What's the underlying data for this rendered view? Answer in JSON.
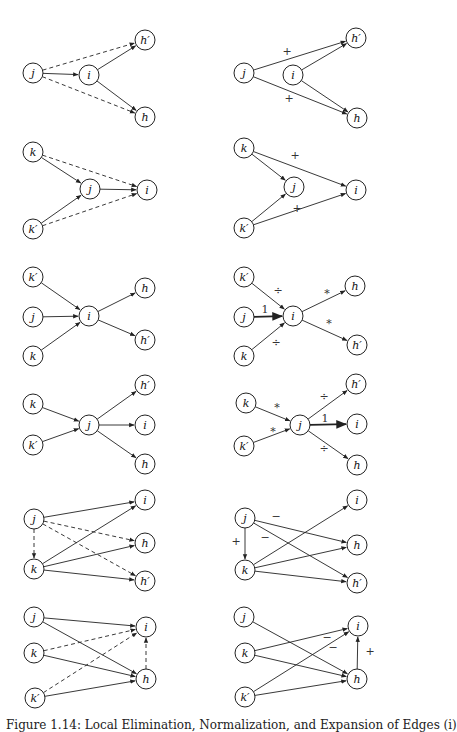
{
  "figure": {
    "caption": "Figure 1.14: Local Elimination, Normalization, and Expansion of Edges (i)",
    "node_radius": 10,
    "stroke_color": "#222222",
    "panels": [
      {
        "id": "row1-left",
        "nodes": [
          {
            "id": "j",
            "label": "j",
            "x": 33,
            "y": 73
          },
          {
            "id": "i",
            "label": "i",
            "x": 89,
            "y": 75
          },
          {
            "id": "hp",
            "label": "h′",
            "x": 145,
            "y": 40
          },
          {
            "id": "h",
            "label": "h",
            "x": 145,
            "y": 117
          }
        ],
        "edges": [
          {
            "from": "j",
            "to": "i",
            "style": "solid",
            "label": ""
          },
          {
            "from": "i",
            "to": "hp",
            "style": "solid",
            "label": ""
          },
          {
            "from": "i",
            "to": "h",
            "style": "solid",
            "label": ""
          },
          {
            "from": "j",
            "to": "hp",
            "style": "dashed",
            "label": ""
          },
          {
            "from": "j",
            "to": "h",
            "style": "dashed",
            "label": ""
          }
        ]
      },
      {
        "id": "row1-right",
        "nodes": [
          {
            "id": "j",
            "label": "j",
            "x": 244,
            "y": 73
          },
          {
            "id": "i",
            "label": "i",
            "x": 293,
            "y": 75
          },
          {
            "id": "hp",
            "label": "h′",
            "x": 356,
            "y": 38
          },
          {
            "id": "h",
            "label": "h",
            "x": 357,
            "y": 118
          }
        ],
        "edges": [
          {
            "from": "j",
            "to": "hp",
            "style": "solid",
            "label": "+",
            "lx": 287,
            "ly": 51
          },
          {
            "from": "j",
            "to": "h",
            "style": "solid",
            "label": "+",
            "lx": 289,
            "ly": 98
          },
          {
            "from": "i",
            "to": "hp",
            "style": "solid",
            "label": ""
          },
          {
            "from": "i",
            "to": "h",
            "style": "solid",
            "label": ""
          }
        ]
      },
      {
        "id": "row2-left",
        "nodes": [
          {
            "id": "k",
            "label": "k",
            "x": 33,
            "y": 152
          },
          {
            "id": "j",
            "label": "j",
            "x": 90,
            "y": 189
          },
          {
            "id": "i",
            "label": "i",
            "x": 147,
            "y": 190
          },
          {
            "id": "kp",
            "label": "k′",
            "x": 33,
            "y": 229
          }
        ],
        "edges": [
          {
            "from": "k",
            "to": "j",
            "style": "solid",
            "label": ""
          },
          {
            "from": "kp",
            "to": "j",
            "style": "solid",
            "label": ""
          },
          {
            "from": "j",
            "to": "i",
            "style": "solid",
            "label": ""
          },
          {
            "from": "k",
            "to": "i",
            "style": "dashed",
            "label": ""
          },
          {
            "from": "kp",
            "to": "i",
            "style": "dashed",
            "label": ""
          }
        ]
      },
      {
        "id": "row2-right",
        "nodes": [
          {
            "id": "k",
            "label": "k",
            "x": 244,
            "y": 148
          },
          {
            "id": "j",
            "label": "j",
            "x": 294,
            "y": 187
          },
          {
            "id": "i",
            "label": "i",
            "x": 356,
            "y": 190
          },
          {
            "id": "kp",
            "label": "k′",
            "x": 244,
            "y": 228
          }
        ],
        "edges": [
          {
            "from": "k",
            "to": "j",
            "style": "solid",
            "label": ""
          },
          {
            "from": "kp",
            "to": "j",
            "style": "solid",
            "label": ""
          },
          {
            "from": "k",
            "to": "i",
            "style": "solid",
            "label": "+",
            "lx": 295,
            "ly": 155
          },
          {
            "from": "kp",
            "to": "i",
            "style": "solid",
            "label": "+",
            "lx": 297,
            "ly": 208
          }
        ]
      },
      {
        "id": "row3-left",
        "nodes": [
          {
            "id": "kp",
            "label": "k′",
            "x": 33,
            "y": 277
          },
          {
            "id": "j",
            "label": "j",
            "x": 33,
            "y": 317
          },
          {
            "id": "k",
            "label": "k",
            "x": 33,
            "y": 356
          },
          {
            "id": "i",
            "label": "i",
            "x": 89,
            "y": 316
          },
          {
            "id": "h",
            "label": "h",
            "x": 145,
            "y": 288
          },
          {
            "id": "hp",
            "label": "h′",
            "x": 145,
            "y": 340
          }
        ],
        "edges": [
          {
            "from": "kp",
            "to": "i",
            "style": "solid",
            "label": ""
          },
          {
            "from": "j",
            "to": "i",
            "style": "solid",
            "label": ""
          },
          {
            "from": "k",
            "to": "i",
            "style": "solid",
            "label": ""
          },
          {
            "from": "i",
            "to": "h",
            "style": "solid",
            "label": ""
          },
          {
            "from": "i",
            "to": "hp",
            "style": "solid",
            "label": ""
          }
        ]
      },
      {
        "id": "row3-right",
        "nodes": [
          {
            "id": "kp",
            "label": "k′",
            "x": 244,
            "y": 277
          },
          {
            "id": "j",
            "label": "j",
            "x": 244,
            "y": 317
          },
          {
            "id": "k",
            "label": "k",
            "x": 244,
            "y": 356
          },
          {
            "id": "i",
            "label": "i",
            "x": 293,
            "y": 316
          },
          {
            "id": "h",
            "label": "h",
            "x": 355,
            "y": 286
          },
          {
            "id": "hp",
            "label": "h′",
            "x": 357,
            "y": 345
          }
        ],
        "edges": [
          {
            "from": "kp",
            "to": "i",
            "style": "solid",
            "label": "÷",
            "lx": 278,
            "ly": 290
          },
          {
            "from": "j",
            "to": "i",
            "style": "bold",
            "label": "1",
            "lx": 265,
            "ly": 309
          },
          {
            "from": "k",
            "to": "i",
            "style": "solid",
            "label": "÷",
            "lx": 276,
            "ly": 342
          },
          {
            "from": "i",
            "to": "h",
            "style": "solid",
            "label": "*",
            "lx": 327,
            "ly": 293
          },
          {
            "from": "i",
            "to": "hp",
            "style": "solid",
            "label": "*",
            "lx": 329,
            "ly": 323
          }
        ]
      },
      {
        "id": "row4-left",
        "nodes": [
          {
            "id": "k",
            "label": "k",
            "x": 33,
            "y": 404
          },
          {
            "id": "kp",
            "label": "k′",
            "x": 33,
            "y": 445
          },
          {
            "id": "j",
            "label": "j",
            "x": 89,
            "y": 425
          },
          {
            "id": "hp",
            "label": "h′",
            "x": 145,
            "y": 385
          },
          {
            "id": "i",
            "label": "i",
            "x": 145,
            "y": 425
          },
          {
            "id": "h",
            "label": "h",
            "x": 145,
            "y": 464
          }
        ],
        "edges": [
          {
            "from": "k",
            "to": "j",
            "style": "solid",
            "label": ""
          },
          {
            "from": "kp",
            "to": "j",
            "style": "solid",
            "label": ""
          },
          {
            "from": "j",
            "to": "hp",
            "style": "solid",
            "label": ""
          },
          {
            "from": "j",
            "to": "i",
            "style": "solid",
            "label": ""
          },
          {
            "from": "j",
            "to": "h",
            "style": "solid",
            "label": ""
          }
        ]
      },
      {
        "id": "row4-right",
        "nodes": [
          {
            "id": "k",
            "label": "k",
            "x": 246,
            "y": 403
          },
          {
            "id": "kp",
            "label": "k′",
            "x": 244,
            "y": 446
          },
          {
            "id": "j",
            "label": "j",
            "x": 300,
            "y": 425
          },
          {
            "id": "hp",
            "label": "h′",
            "x": 356,
            "y": 384
          },
          {
            "id": "i",
            "label": "i",
            "x": 357,
            "y": 424
          },
          {
            "id": "h",
            "label": "h",
            "x": 357,
            "y": 465
          }
        ],
        "edges": [
          {
            "from": "k",
            "to": "j",
            "style": "solid",
            "label": "*",
            "lx": 277,
            "ly": 407
          },
          {
            "from": "kp",
            "to": "j",
            "style": "solid",
            "label": "*",
            "lx": 273,
            "ly": 431
          },
          {
            "from": "j",
            "to": "hp",
            "style": "solid",
            "label": "÷",
            "lx": 324,
            "ly": 396
          },
          {
            "from": "j",
            "to": "i",
            "style": "bold",
            "label": "1",
            "lx": 325,
            "ly": 418
          },
          {
            "from": "j",
            "to": "h",
            "style": "solid",
            "label": "÷",
            "lx": 324,
            "ly": 448
          }
        ]
      },
      {
        "id": "row5-left",
        "nodes": [
          {
            "id": "j",
            "label": "j",
            "x": 34,
            "y": 519
          },
          {
            "id": "k",
            "label": "k",
            "x": 34,
            "y": 569
          },
          {
            "id": "i",
            "label": "i",
            "x": 145,
            "y": 500
          },
          {
            "id": "h",
            "label": "h",
            "x": 145,
            "y": 543
          },
          {
            "id": "hp",
            "label": "h′",
            "x": 145,
            "y": 581
          }
        ],
        "edges": [
          {
            "from": "j",
            "to": "i",
            "style": "solid",
            "label": ""
          },
          {
            "from": "k",
            "to": "i",
            "style": "solid",
            "label": ""
          },
          {
            "from": "k",
            "to": "h",
            "style": "solid",
            "label": ""
          },
          {
            "from": "k",
            "to": "hp",
            "style": "solid",
            "label": ""
          },
          {
            "from": "j",
            "to": "k",
            "style": "dashed",
            "label": ""
          },
          {
            "from": "j",
            "to": "h",
            "style": "dashed",
            "label": ""
          },
          {
            "from": "j",
            "to": "hp",
            "style": "dashed",
            "label": ""
          }
        ]
      },
      {
        "id": "row5-right",
        "nodes": [
          {
            "id": "j",
            "label": "j",
            "x": 245,
            "y": 518
          },
          {
            "id": "k",
            "label": "k",
            "x": 245,
            "y": 570
          },
          {
            "id": "i",
            "label": "i",
            "x": 357,
            "y": 500
          },
          {
            "id": "h",
            "label": "h",
            "x": 357,
            "y": 545
          },
          {
            "id": "hp",
            "label": "h′",
            "x": 357,
            "y": 583
          }
        ],
        "edges": [
          {
            "from": "j",
            "to": "k",
            "style": "solid",
            "label": "+",
            "lx": 236,
            "ly": 541
          },
          {
            "from": "j",
            "to": "h",
            "style": "solid",
            "label": "−",
            "lx": 276,
            "ly": 516
          },
          {
            "from": "j",
            "to": "hp",
            "style": "solid",
            "label": "−",
            "lx": 265,
            "ly": 537
          },
          {
            "from": "k",
            "to": "i",
            "style": "solid",
            "label": ""
          },
          {
            "from": "k",
            "to": "h",
            "style": "solid",
            "label": ""
          },
          {
            "from": "k",
            "to": "hp",
            "style": "solid",
            "label": ""
          }
        ]
      },
      {
        "id": "row6-left",
        "nodes": [
          {
            "id": "j",
            "label": "j",
            "x": 34,
            "y": 617
          },
          {
            "id": "k",
            "label": "k",
            "x": 34,
            "y": 653
          },
          {
            "id": "kp",
            "label": "k′",
            "x": 35,
            "y": 698
          },
          {
            "id": "i",
            "label": "i",
            "x": 146,
            "y": 627
          },
          {
            "id": "h",
            "label": "h",
            "x": 146,
            "y": 679
          }
        ],
        "edges": [
          {
            "from": "j",
            "to": "i",
            "style": "solid",
            "label": ""
          },
          {
            "from": "j",
            "to": "h",
            "style": "solid",
            "label": ""
          },
          {
            "from": "k",
            "to": "h",
            "style": "solid",
            "label": ""
          },
          {
            "from": "kp",
            "to": "h",
            "style": "solid",
            "label": ""
          },
          {
            "from": "k",
            "to": "i",
            "style": "dashed",
            "label": ""
          },
          {
            "from": "kp",
            "to": "i",
            "style": "dashed",
            "label": ""
          },
          {
            "from": "h",
            "to": "i",
            "style": "dashed",
            "label": ""
          }
        ]
      },
      {
        "id": "row6-right",
        "nodes": [
          {
            "id": "j",
            "label": "j",
            "x": 244,
            "y": 617
          },
          {
            "id": "k",
            "label": "k",
            "x": 245,
            "y": 653
          },
          {
            "id": "kp",
            "label": "k′",
            "x": 245,
            "y": 697
          },
          {
            "id": "i",
            "label": "i",
            "x": 358,
            "y": 626
          },
          {
            "id": "h",
            "label": "h",
            "x": 357,
            "y": 679
          }
        ],
        "edges": [
          {
            "from": "j",
            "to": "h",
            "style": "solid",
            "label": ""
          },
          {
            "from": "k",
            "to": "i",
            "style": "solid",
            "label": "−",
            "lx": 327,
            "ly": 637
          },
          {
            "from": "k",
            "to": "h",
            "style": "solid",
            "label": ""
          },
          {
            "from": "kp",
            "to": "i",
            "style": "solid",
            "label": "−",
            "lx": 333,
            "ly": 647
          },
          {
            "from": "kp",
            "to": "h",
            "style": "solid",
            "label": ""
          },
          {
            "from": "h",
            "to": "i",
            "style": "solid",
            "label": "+",
            "lx": 370,
            "ly": 651
          }
        ]
      }
    ]
  }
}
